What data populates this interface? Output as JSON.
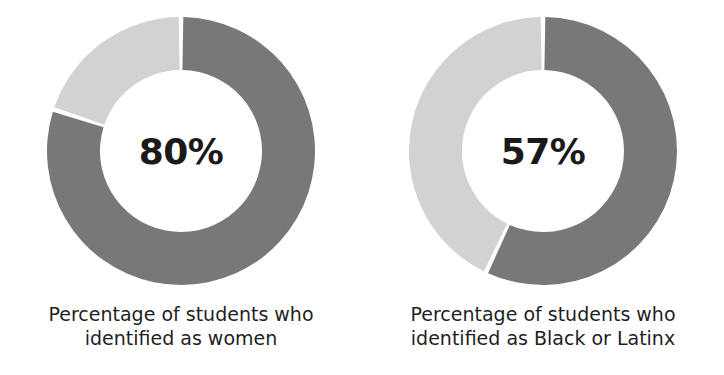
{
  "figure": {
    "background_color": "#ffffff",
    "dark_color": "#787878",
    "light_color": "#d2d2d2",
    "text_color": "#1a1a1a"
  },
  "charts": [
    {
      "center_label": "80%",
      "caption_line1": "Percentage of students who",
      "caption_line2": "identified as women"
    },
    {
      "center_label": "57%",
      "caption_line1": "Percentage of students who",
      "caption_line2": "identified as Black or Latinx"
    }
  ],
  "chart_data": [
    {
      "type": "pie",
      "variant": "donut",
      "title": "Percentage of students who identified as women",
      "categories": [
        "Identified as women",
        "Did not identify as women"
      ],
      "values": [
        80,
        20
      ],
      "value_unit": "percent",
      "colors": [
        "#787878",
        "#d2d2d2"
      ],
      "center_label": "80%",
      "start_angle_deg": 0,
      "direction": "clockwise",
      "inner_radius_ratio": 0.6,
      "legend": "none",
      "grid": false,
      "xlabel": "",
      "ylabel": ""
    },
    {
      "type": "pie",
      "variant": "donut",
      "title": "Percentage of students who identified as Black or Latinx",
      "categories": [
        "Identified as Black or Latinx",
        "Did not identify as Black or Latinx"
      ],
      "values": [
        57,
        43
      ],
      "value_unit": "percent",
      "colors": [
        "#787878",
        "#d2d2d2"
      ],
      "center_label": "57%",
      "start_angle_deg": 0,
      "direction": "clockwise",
      "inner_radius_ratio": 0.6,
      "legend": "none",
      "grid": false,
      "xlabel": "",
      "ylabel": ""
    }
  ]
}
